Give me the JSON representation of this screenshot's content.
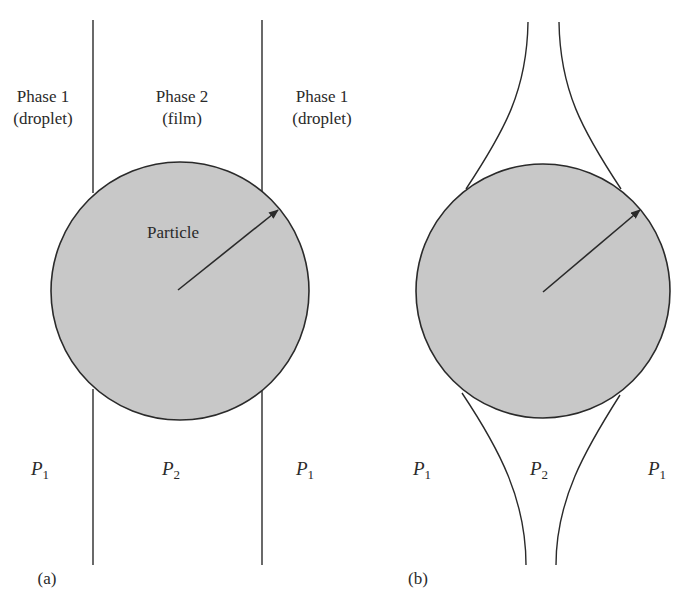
{
  "figure": {
    "panel_a": {
      "caption": "(a)",
      "region_labels": [
        {
          "line1": "Phase 1",
          "line2": "(droplet)"
        },
        {
          "line1": "Phase 2",
          "line2": "(film)"
        },
        {
          "line1": "Phase 1",
          "line2": "(droplet)"
        }
      ],
      "particle_label": "Particle",
      "pressure_labels": [
        {
          "symbol": "P",
          "subscript": "1"
        },
        {
          "symbol": "P",
          "subscript": "2"
        },
        {
          "symbol": "P",
          "subscript": "1"
        }
      ]
    },
    "panel_b": {
      "caption": "(b)",
      "pressure_labels": [
        {
          "symbol": "P",
          "subscript": "1"
        },
        {
          "symbol": "P",
          "subscript": "2"
        },
        {
          "symbol": "P",
          "subscript": "1"
        }
      ]
    },
    "colors": {
      "particle_fill": "#c8c8c8",
      "line": "#2a2a2a",
      "background": "#ffffff"
    }
  }
}
